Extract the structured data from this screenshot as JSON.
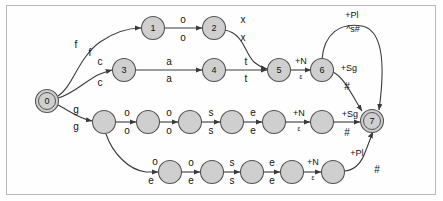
{
  "figure": {
    "border_color": "#b9b9b9",
    "node_fill": "#cfcfcf",
    "node_stroke": "#555555",
    "edge_color": "#3a3a3a",
    "background": "#ffffff"
  },
  "states": [
    {
      "id": "q0",
      "label": "0",
      "x": 47,
      "y": 101,
      "kind": "start",
      "labeled": true
    },
    {
      "id": "q1",
      "label": "1",
      "x": 153,
      "y": 28,
      "kind": "normal",
      "labeled": true
    },
    {
      "id": "q2",
      "label": "2",
      "x": 214,
      "y": 28,
      "kind": "normal",
      "labeled": true
    },
    {
      "id": "q3",
      "label": "3",
      "x": 124,
      "y": 70,
      "kind": "normal",
      "labeled": true
    },
    {
      "id": "q4",
      "label": "4",
      "x": 214,
      "y": 70,
      "kind": "normal",
      "labeled": true
    },
    {
      "id": "q5",
      "label": "5",
      "x": 279,
      "y": 70,
      "kind": "normal",
      "labeled": true
    },
    {
      "id": "q6",
      "label": "6",
      "x": 322,
      "y": 70,
      "kind": "normal",
      "labeled": true
    },
    {
      "id": "q7",
      "label": "7",
      "x": 372,
      "y": 121,
      "kind": "accepting",
      "labeled": true
    },
    {
      "id": "r1",
      "label": "",
      "x": 104,
      "y": 122,
      "kind": "normal",
      "labeled": false
    },
    {
      "id": "r2",
      "label": "",
      "x": 148,
      "y": 122,
      "kind": "normal",
      "labeled": false
    },
    {
      "id": "r3",
      "label": "",
      "x": 190,
      "y": 122,
      "kind": "normal",
      "labeled": false
    },
    {
      "id": "r4",
      "label": "",
      "x": 232,
      "y": 122,
      "kind": "normal",
      "labeled": false
    },
    {
      "id": "r5",
      "label": "",
      "x": 274,
      "y": 122,
      "kind": "normal",
      "labeled": false
    },
    {
      "id": "r6",
      "label": "",
      "x": 322,
      "y": 122,
      "kind": "normal",
      "labeled": false
    },
    {
      "id": "s1",
      "label": "",
      "x": 170,
      "y": 172,
      "kind": "normal",
      "labeled": false
    },
    {
      "id": "s2",
      "label": "",
      "x": 212,
      "y": 172,
      "kind": "normal",
      "labeled": false
    },
    {
      "id": "s3",
      "label": "",
      "x": 252,
      "y": 172,
      "kind": "normal",
      "labeled": false
    },
    {
      "id": "s4",
      "label": "",
      "x": 292,
      "y": 172,
      "kind": "normal",
      "labeled": false
    },
    {
      "id": "s5",
      "label": "",
      "x": 333,
      "y": 172,
      "kind": "normal",
      "labeled": false
    }
  ],
  "transitions": [
    {
      "id": "t-0-1",
      "from": "q0",
      "to": "q1",
      "upper": "f",
      "lower": "f",
      "upper_x": 76,
      "upper_y": 48,
      "lower_x": 90,
      "lower_y": 56
    },
    {
      "id": "t-1-2",
      "from": "q1",
      "to": "q2",
      "upper": "o",
      "lower": "o",
      "upper_x": 183,
      "upper_y": 23,
      "lower_x": 183,
      "lower_y": 41
    },
    {
      "id": "t-2-5",
      "from": "q2",
      "to": "q5",
      "upper": "x",
      "lower": "x",
      "upper_x": 243,
      "upper_y": 23,
      "lower_x": 243,
      "lower_y": 41
    },
    {
      "id": "t-0-3",
      "from": "q0",
      "to": "q3",
      "upper": "c",
      "lower": "c",
      "upper_x": 100,
      "upper_y": 65,
      "lower_x": 100,
      "lower_y": 86
    },
    {
      "id": "t-3-4",
      "from": "q3",
      "to": "q4",
      "upper": "a",
      "lower": "a",
      "upper_x": 169,
      "upper_y": 65,
      "lower_x": 169,
      "lower_y": 82
    },
    {
      "id": "t-4-5",
      "from": "q4",
      "to": "q5",
      "upper": "t",
      "lower": "t",
      "upper_x": 246,
      "upper_y": 65,
      "lower_x": 246,
      "lower_y": 82
    },
    {
      "id": "t-5-6",
      "from": "q5",
      "to": "q6",
      "upper": "+N",
      "lower": "ε",
      "upper_x": 301,
      "upper_y": 64,
      "lower_x": 301,
      "lower_y": 79
    },
    {
      "id": "t-6-7-pl",
      "from": "q6",
      "to": "q7",
      "upper": "+Pl",
      "lower": "^s#",
      "upper_x": 352,
      "upper_y": 18,
      "lower_x": 353,
      "lower_y": 32
    },
    {
      "id": "t-6-7-sg",
      "from": "q6",
      "to": "q7",
      "upper": "+Sg",
      "lower": "#",
      "upper_x": 349,
      "upper_y": 71,
      "lower_x": 347,
      "lower_y": 90
    },
    {
      "id": "t-0-r1",
      "from": "q0",
      "to": "r1",
      "upper": "g",
      "lower": "g",
      "upper_x": 76,
      "upper_y": 113,
      "lower_x": 76,
      "lower_y": 130
    },
    {
      "id": "t-r1-r2",
      "from": "r1",
      "to": "r2",
      "upper": "o",
      "lower": "o",
      "upper_x": 127,
      "upper_y": 116,
      "lower_x": 127,
      "lower_y": 134
    },
    {
      "id": "t-r2-r3",
      "from": "r2",
      "to": "r3",
      "upper": "o",
      "lower": "o",
      "upper_x": 169,
      "upper_y": 116,
      "lower_x": 169,
      "lower_y": 134
    },
    {
      "id": "t-r3-r4",
      "from": "r3",
      "to": "r4",
      "upper": "s",
      "lower": "s",
      "upper_x": 211,
      "upper_y": 116,
      "lower_x": 211,
      "lower_y": 134
    },
    {
      "id": "t-r4-r5",
      "from": "r4",
      "to": "r5",
      "upper": "e",
      "lower": "e",
      "upper_x": 253,
      "upper_y": 116,
      "lower_x": 253,
      "lower_y": 134
    },
    {
      "id": "t-r5-r6",
      "from": "r5",
      "to": "r6",
      "upper": "+N",
      "lower": "ε",
      "upper_x": 299,
      "upper_y": 116,
      "lower_x": 299,
      "lower_y": 131
    },
    {
      "id": "t-r6-7",
      "from": "r6",
      "to": "q7",
      "upper": "+Sg",
      "lower": "#",
      "upper_x": 350,
      "upper_y": 117,
      "lower_x": 347,
      "lower_y": 136
    },
    {
      "id": "t-r1-s1",
      "from": "r1",
      "to": "s1",
      "upper": "o",
      "lower": "e",
      "upper_x": 155,
      "upper_y": 165,
      "lower_x": 151,
      "lower_y": 184
    },
    {
      "id": "t-s1-s2",
      "from": "s1",
      "to": "s2",
      "upper": "o",
      "lower": "e",
      "upper_x": 191,
      "upper_y": 166,
      "lower_x": 191,
      "lower_y": 184
    },
    {
      "id": "t-s2-s3",
      "from": "s2",
      "to": "s3",
      "upper": "s",
      "lower": "s",
      "upper_x": 232,
      "upper_y": 166,
      "lower_x": 232,
      "lower_y": 184
    },
    {
      "id": "t-s3-s4",
      "from": "s3",
      "to": "s4",
      "upper": "e",
      "lower": "e",
      "upper_x": 272,
      "upper_y": 166,
      "lower_x": 272,
      "lower_y": 184
    },
    {
      "id": "t-s4-s5",
      "from": "s4",
      "to": "s5",
      "upper": "+N",
      "lower": "ε",
      "upper_x": 313,
      "upper_y": 165,
      "lower_x": 313,
      "lower_y": 180
    },
    {
      "id": "t-s5-7",
      "from": "s5",
      "to": "q7",
      "upper": "+Pl",
      "lower": "#",
      "upper_x": 357,
      "upper_y": 156,
      "lower_x": 377,
      "lower_y": 173
    }
  ]
}
